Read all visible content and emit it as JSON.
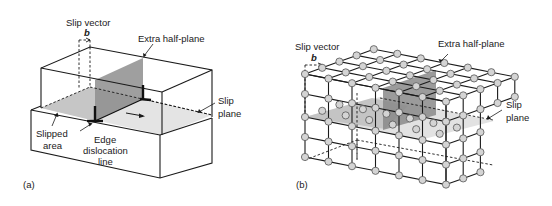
{
  "figure": {
    "panels": [
      {
        "id": "a",
        "tag": "(a)",
        "labels": {
          "slip_vector": "Slip vector",
          "burgers": "b",
          "extra_half_plane": "Extra half-plane",
          "slip_plane_1": "Slip",
          "slip_plane_2": "plane",
          "slipped_area_1": "Slipped",
          "slipped_area_2": "area",
          "edge_dislocation_1": "Edge",
          "edge_dislocation_2": "dislocation",
          "edge_dislocation_3": "line"
        }
      },
      {
        "id": "b",
        "tag": "(b)",
        "labels": {
          "slip_vector": "Slip vector",
          "burgers": "b",
          "extra_half_plane": "Extra half-plane",
          "slip_plane_1": "Slip",
          "slip_plane_2": "plane"
        }
      }
    ],
    "colors": {
      "line": "#1a1a1a",
      "slip_plane_fill": "#e2e2e2",
      "slipped_area_fill": "#c8c8c8",
      "half_plane_fill": "#8c8c8c",
      "atom_fill": "#d4d4d4"
    }
  }
}
